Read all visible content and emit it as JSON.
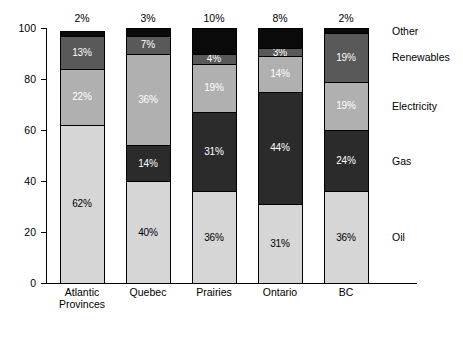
{
  "chart_data": {
    "type": "bar",
    "title": "",
    "subtitle": "",
    "xlabel": "",
    "ylabel": "",
    "stacked": true,
    "grid": false,
    "legend_position": "right",
    "ylim": [
      0,
      100
    ],
    "yticks": [
      0,
      20,
      40,
      60,
      80,
      100
    ],
    "ytick_labels": [
      "0",
      "20",
      "40",
      "60",
      "80",
      "100"
    ],
    "categories": [
      "Atlantic Provinces",
      "Quebec",
      "Prairies",
      "Ontario",
      "BC"
    ],
    "category_lines": [
      [
        "Atlantic",
        "Provinces"
      ],
      [
        "Quebec"
      ],
      [
        "Prairies"
      ],
      [
        "Ontario"
      ],
      [
        "BC"
      ]
    ],
    "series": [
      {
        "name": "Oil",
        "color": "#d6d6d6",
        "label_color": "#000000",
        "values": [
          62,
          40,
          36,
          31,
          36
        ],
        "labels": [
          "62%",
          "40%",
          "36%",
          "31%",
          "36%"
        ]
      },
      {
        "name": "Gas",
        "color": "#2b2b2b",
        "label_color": "#ffffff",
        "values": [
          0,
          14,
          31,
          44,
          24
        ],
        "labels": [
          "",
          "14%",
          "31%",
          "44%",
          "24%"
        ]
      },
      {
        "name": "Electricity",
        "color": "#b0b0b0",
        "label_color": "#ffffff",
        "values": [
          22,
          36,
          19,
          14,
          19
        ],
        "labels": [
          "22%",
          "36%",
          "19%",
          "14%",
          "19%"
        ]
      },
      {
        "name": "Renewables",
        "color": "#595959",
        "label_color": "#ffffff",
        "values": [
          13,
          7,
          4,
          3,
          19
        ],
        "labels": [
          "13%",
          "7%",
          "4%",
          "3%",
          "19%"
        ]
      },
      {
        "name": "Other",
        "color": "#0a0a0a",
        "label_color": "#ffffff",
        "values": [
          2,
          3,
          10,
          8,
          2
        ],
        "labels": [
          "",
          "",
          "",
          "",
          ""
        ]
      }
    ],
    "top_annotations": [
      "2%",
      "3%",
      "10%",
      "8%",
      "2%"
    ],
    "legend_entries": [
      "Other",
      "Renewables",
      "Electricity",
      "Gas",
      "Oil"
    ]
  },
  "axis": {
    "tick_0": "0",
    "tick_20": "20",
    "tick_40": "40",
    "tick_60": "60",
    "tick_80": "80",
    "tick_100": "100"
  },
  "legend": {
    "other": "Other",
    "renewables": "Renewables",
    "electricity": "Electricity",
    "gas": "Gas",
    "oil": "Oil"
  }
}
